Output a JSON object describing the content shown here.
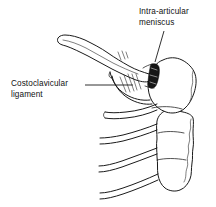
{
  "figure": {
    "kind": "anatomical-line-drawing",
    "background_color": "#ffffff",
    "ink_color": "#1a1a1a",
    "width": 216,
    "height": 207
  },
  "labels": {
    "meniscus": {
      "line1": "Intra-articular",
      "line2": "meniscus",
      "leader": "diagonal line from text down-left to joint disc"
    },
    "costoclavicular": {
      "line1": "Costoclavicular",
      "line2": "ligament",
      "leader": "horizontal line from text right to ligament fibers"
    }
  },
  "structures": {
    "clavicle": "clavicle",
    "manubrium": "manubrium of sternum",
    "sternum_body": "body of sternum",
    "ribs": "costal cartilages and ribs",
    "meniscus_disc": "intra-articular meniscus",
    "ligament_fibers": "costoclavicular ligament fibers"
  }
}
